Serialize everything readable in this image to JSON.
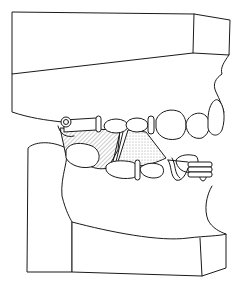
{
  "figure": {
    "title": "Dental cast model in occlusion, lateral view, with removable appliance",
    "colors": {
      "line": "#1a1a1a",
      "background": "#ffffff",
      "hatch": "#9a9a9a",
      "stipple": "#8a8a8a"
    },
    "parts": [
      "upper-cast-base",
      "lower-cast-base",
      "upper-teeth",
      "lower-teeth",
      "hatched-saddle",
      "stippled-saddle",
      "clasp-posterior",
      "clasp-anterior"
    ]
  }
}
